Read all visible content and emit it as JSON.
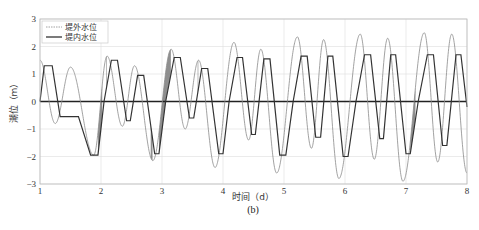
{
  "chart_data": {
    "type": "line",
    "title": "",
    "caption": "(b)",
    "xlabel": "时间（d）",
    "ylabel": "潮位（m）",
    "xlim": [
      1,
      8
    ],
    "ylim": [
      -3,
      3
    ],
    "xticks": [
      1,
      2,
      3,
      4,
      5,
      6,
      7,
      8
    ],
    "yticks": [
      -3,
      -2,
      -1,
      0,
      1,
      2,
      3
    ],
    "grid": true,
    "legend_position": "upper left",
    "series": [
      {
        "name": "堤外水位",
        "style": "thin gray line",
        "color": "#8a8a8a",
        "extrema_x": [
          1.0,
          1.25,
          1.5,
          1.88,
          2.1,
          2.35,
          2.55,
          2.85,
          3.15,
          3.38,
          3.6,
          3.87,
          4.18,
          4.42,
          4.62,
          4.88,
          5.22,
          5.45,
          5.65,
          5.9,
          6.25,
          6.48,
          6.7,
          6.95,
          7.3,
          7.52,
          7.75,
          8.0
        ],
        "extrema_y": [
          1.5,
          -0.8,
          1.25,
          -1.95,
          1.65,
          -0.9,
          1.3,
          -2.15,
          1.9,
          -1.0,
          1.5,
          -2.4,
          2.15,
          -1.4,
          1.9,
          -2.6,
          2.35,
          -1.7,
          2.25,
          -2.8,
          2.45,
          -2.1,
          2.3,
          -2.9,
          2.5,
          -2.2,
          2.45,
          -2.6
        ]
      },
      {
        "name": "堤内水位",
        "style": "dark stepped line",
        "color": "#333333",
        "x": [
          1.0,
          1.07,
          1.2,
          1.33,
          1.63,
          1.83,
          1.95,
          2.05,
          2.17,
          2.27,
          2.42,
          2.48,
          2.6,
          2.7,
          2.88,
          2.95,
          3.06,
          3.2,
          3.3,
          3.45,
          3.52,
          3.65,
          3.75,
          3.93,
          4.0,
          4.1,
          4.23,
          4.32,
          4.47,
          4.53,
          4.67,
          4.77,
          4.93,
          5.03,
          5.15,
          5.28,
          5.38,
          5.52,
          5.6,
          5.72,
          5.8,
          5.97,
          6.05,
          6.18,
          6.32,
          6.42,
          6.57,
          6.63,
          6.75,
          6.83,
          7.0,
          7.07,
          7.2,
          7.35,
          7.45,
          7.6,
          7.67,
          7.82,
          7.9,
          8.0
        ],
        "y": [
          0,
          1.3,
          1.3,
          -0.55,
          -0.55,
          -1.95,
          -1.95,
          0,
          1.5,
          1.5,
          -0.7,
          -0.7,
          0.95,
          0.95,
          -1.9,
          -1.9,
          0,
          1.6,
          1.6,
          -0.6,
          -0.6,
          1.2,
          1.2,
          -1.9,
          -1.9,
          0,
          1.6,
          1.6,
          -1.2,
          -1.2,
          1.55,
          1.55,
          -1.95,
          -1.95,
          0,
          1.65,
          1.65,
          -1.3,
          -1.3,
          1.65,
          1.65,
          -2.0,
          -2.0,
          0,
          1.7,
          1.7,
          -1.35,
          -1.35,
          1.7,
          1.7,
          -1.9,
          -1.9,
          0,
          1.7,
          1.7,
          -1.6,
          -1.6,
          1.7,
          1.7,
          -0.2
        ]
      },
      {
        "name": "zero-line",
        "style": "thick dark horizontal line",
        "color": "#222222",
        "x": [
          1,
          8
        ],
        "y": [
          0,
          0
        ]
      }
    ],
    "legend_entries": [
      "堤外水位",
      "堤内水位"
    ]
  },
  "colors": {
    "grid": "#dddddd",
    "axis": "#999999",
    "fill_band": "#7a7a7a"
  }
}
